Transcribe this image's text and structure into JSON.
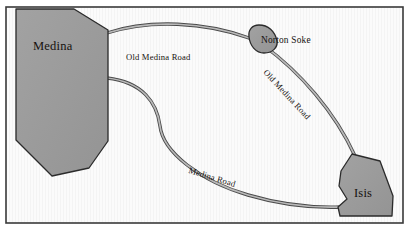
{
  "figure": {
    "type": "schematic-road-map",
    "width": 411,
    "height": 233,
    "frame": {
      "visible": true,
      "color": "#3a3a3a"
    },
    "background_color": "#fbfbfb",
    "region_fill": "#9a9a9a",
    "region_stroke": "#2b2b2b",
    "road_color": "#8d8d8d",
    "road_casing_color": "#4f4f4f"
  },
  "regions": [
    {
      "id": "medina",
      "label": "Medina"
    },
    {
      "id": "norton-soke",
      "label": "Norton Soke"
    },
    {
      "id": "isis",
      "label": "Isis"
    }
  ],
  "roads": [
    {
      "id": "old-medina-road-west",
      "label": "Old Medina Road",
      "from": "Medina",
      "to": "Norton Soke"
    },
    {
      "id": "old-medina-road-east",
      "label": "Old Medina Road",
      "from": "Norton Soke",
      "to": "Isis"
    },
    {
      "id": "medina-road",
      "label": "Medina Road",
      "from": "Medina",
      "to": "Isis"
    }
  ]
}
